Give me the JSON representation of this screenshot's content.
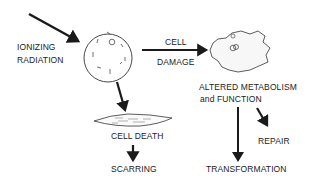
{
  "diagram": {
    "labels": {
      "ionizing": "IONIZING",
      "radiation": "RADIATION",
      "cell": "CELL",
      "damage": "DAMAGE",
      "altered": "ALTERED METABOLISM",
      "function": "and  FUNCTION",
      "cell_death": "CELL  DEATH",
      "scarring": "SCARRING",
      "repair": "REPAIR",
      "transformation": "TRANSFORMATION"
    },
    "nodes": [
      "ionizing-radiation",
      "normal-cell",
      "damaged-cell",
      "cell-death",
      "scarring",
      "altered-metabolism",
      "repair",
      "transformation"
    ],
    "edges": [
      {
        "from": "ionizing-radiation",
        "to": "normal-cell"
      },
      {
        "from": "normal-cell",
        "to": "damaged-cell",
        "label": "CELL DAMAGE"
      },
      {
        "from": "normal-cell",
        "to": "cell-death"
      },
      {
        "from": "cell-death",
        "to": "scarring"
      },
      {
        "from": "altered-metabolism",
        "to": "transformation"
      },
      {
        "from": "altered-metabolism",
        "to": "repair"
      }
    ],
    "colors": {
      "ink": "#1a1a1a",
      "background": "#ffffff"
    }
  }
}
